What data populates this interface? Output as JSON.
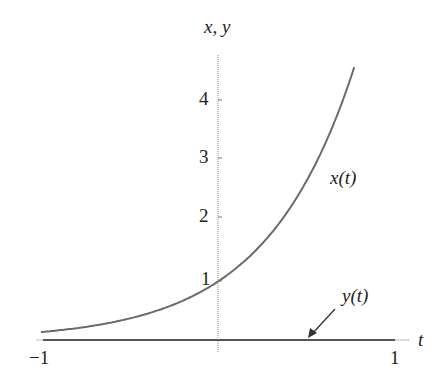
{
  "chart_data": {
    "type": "line",
    "title": "",
    "xlabel": "t",
    "ylabel": "x, y",
    "xlim": [
      -1,
      1
    ],
    "ylim": [
      0,
      4.6
    ],
    "x_ticks": [
      "-1",
      "1"
    ],
    "y_ticks": [
      "1",
      "2",
      "3",
      "4"
    ],
    "grid": false,
    "series": [
      {
        "name": "x(t)",
        "formula": "e^(2t)",
        "x": [
          -1,
          -0.5,
          0,
          0.25,
          0.5,
          0.75
        ],
        "values": [
          0.14,
          0.37,
          1.0,
          1.65,
          2.72,
          4.48
        ]
      },
      {
        "name": "y(t)",
        "formula": "0",
        "x": [
          -1,
          1
        ],
        "values": [
          0,
          0
        ]
      }
    ],
    "annotations": [
      {
        "text": "x(t)",
        "position": "right of curve near x=2.6"
      },
      {
        "text": "y(t)",
        "position": "above axis with arrow pointing to t≈0.7"
      }
    ]
  },
  "labels": {
    "y_axis": "x, y",
    "x_axis": "t",
    "tick_neg1": "−1",
    "tick_pos1": "1",
    "tick_y1": "1",
    "tick_y2": "2",
    "tick_y3": "3",
    "tick_y4": "4",
    "series_x": "x(t)",
    "series_y": "y(t)"
  },
  "colors": {
    "curve": "#6b6b6b",
    "axis": "#555555",
    "text": "#222222"
  }
}
